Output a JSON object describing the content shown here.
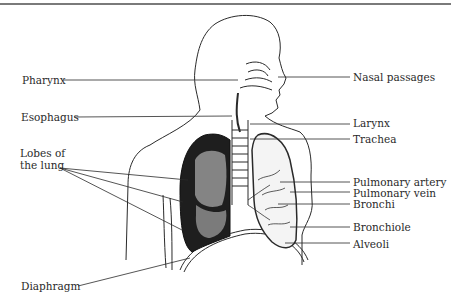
{
  "diagram": {
    "left_labels": [
      {
        "id": "pharynx",
        "text": "Pharynx"
      },
      {
        "id": "esophagus",
        "text": "Esophagus"
      },
      {
        "id": "lobes",
        "text": "Lobes of the lung",
        "line1": "Lobes of",
        "line2": "the lung"
      },
      {
        "id": "diaphragm",
        "text": "Diaphragm"
      }
    ],
    "right_labels": [
      {
        "id": "nasal",
        "text": "Nasal passages"
      },
      {
        "id": "larynx",
        "text": "Larynx"
      },
      {
        "id": "trachea",
        "text": "Trachea"
      },
      {
        "id": "pulm-artery",
        "text": "Pulmonary artery"
      },
      {
        "id": "pulm-vein",
        "text": "Pulmonary vein"
      },
      {
        "id": "bronchi",
        "text": "Bronchi"
      },
      {
        "id": "bronchiole",
        "text": "Bronchiole"
      },
      {
        "id": "alveoli",
        "text": "Alveoli"
      }
    ],
    "colors": {
      "ink": "#2a2a2a",
      "border": "#7a7a7a",
      "lung_dark": "#1a1a1a"
    }
  }
}
